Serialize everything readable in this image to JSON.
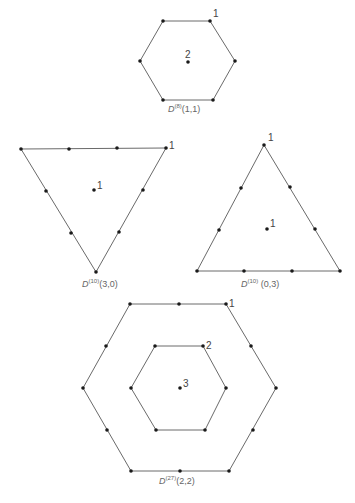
{
  "diagrams": [
    {
      "id": "D8",
      "label": {
        "symbol": "D",
        "dim": "(8)",
        "args": "(1,1)"
      },
      "shape": "hexagon",
      "outer_multiplicity": "1",
      "center_multiplicity": "2"
    },
    {
      "id": "D10_30",
      "label": {
        "symbol": "D",
        "dim": "(10)",
        "args": "(3,0)"
      },
      "shape": "inverted-triangle",
      "outer_multiplicity": "1",
      "center_multiplicity": "1"
    },
    {
      "id": "D10_03",
      "label": {
        "symbol": "D",
        "dim": "(10)",
        "args": "(0,3)"
      },
      "shape": "triangle",
      "outer_multiplicity": "1",
      "center_multiplicity": "1"
    },
    {
      "id": "D27",
      "label": {
        "symbol": "D",
        "dim": "(27)",
        "args": "(2,2)"
      },
      "shape": "double-hexagon",
      "outer_multiplicity": "1",
      "inner_multiplicity": "2",
      "center_multiplicity": "3"
    }
  ]
}
